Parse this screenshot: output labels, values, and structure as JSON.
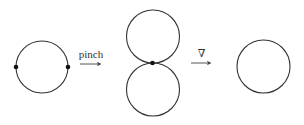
{
  "diagram": {
    "stages": [
      {
        "name": "circle-with-two-points",
        "marked_points": 2
      },
      {
        "name": "figure-eight",
        "marked_points": 1
      },
      {
        "name": "circle",
        "marked_points": 0
      }
    ],
    "arrows": [
      {
        "label": "pinch"
      },
      {
        "label": "∇"
      }
    ],
    "colors": {
      "stroke": "#333333",
      "dot": "#111111"
    }
  }
}
